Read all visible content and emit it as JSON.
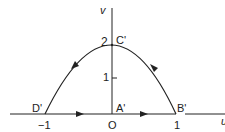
{
  "diagram": {
    "title": "",
    "axes": {
      "vertical_label": "v",
      "horizontal_label": "u"
    },
    "points": {
      "A": "A'",
      "B": "B'",
      "C": "C'",
      "D": "D'"
    },
    "ticks": {
      "x_neg1": "−1",
      "x_origin": "O",
      "x_pos1": "1",
      "y_1": "1",
      "y_2": "2"
    },
    "colors": {
      "stroke": "#222222",
      "background": "#ffffff"
    }
  }
}
